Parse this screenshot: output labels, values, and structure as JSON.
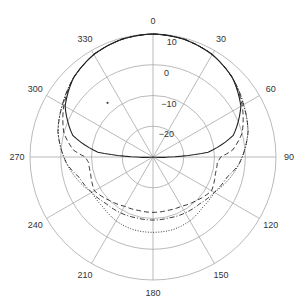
{
  "chart_data": {
    "type": "polar",
    "title": "",
    "angle_unit": "deg",
    "angle_direction": "clockwise",
    "zero_location": "top",
    "angle_ticks": [
      0,
      30,
      60,
      90,
      120,
      150,
      180,
      210,
      240,
      270,
      300,
      330
    ],
    "angle_tick_labels": [
      "0",
      "30",
      "60",
      "90",
      "120",
      "150",
      "180",
      "210",
      "240",
      "270",
      "300",
      "330"
    ],
    "radial_ticks": [
      -20,
      -10,
      0,
      10
    ],
    "radial_tick_labels": [
      "-20",
      "-10",
      "0",
      "10"
    ],
    "rlim": [
      -30,
      10
    ],
    "radial_label_angle": 5,
    "grid": true,
    "legend": null,
    "series": [
      {
        "name": "solid",
        "style": "solid",
        "angles": [
          0,
          15,
          30,
          45,
          60,
          75,
          85,
          90,
          95,
          105,
          120,
          135,
          150,
          165,
          180,
          195,
          210,
          225,
          240,
          255,
          265,
          270,
          275,
          285,
          300,
          315,
          330,
          345,
          360
        ],
        "values": [
          10,
          9.6,
          8.5,
          6.5,
          3,
          -3,
          -12,
          -25,
          -29,
          -30,
          -30,
          -30,
          -30,
          -30,
          -30,
          -30,
          -30,
          -30,
          -30,
          -30,
          -29,
          -25,
          -12,
          -3,
          3,
          6.5,
          8.5,
          9.6,
          10
        ]
      },
      {
        "name": "dashed",
        "style": "dashed",
        "angles": [
          0,
          15,
          30,
          45,
          60,
          75,
          85,
          90,
          95,
          105,
          120,
          135,
          150,
          165,
          180,
          195,
          210,
          225,
          240,
          255,
          265,
          270,
          275,
          285,
          300,
          315,
          330,
          345,
          360
        ],
        "values": [
          10,
          9.6,
          8.5,
          6.5,
          3.5,
          0,
          -4,
          -8,
          -9,
          -9,
          -8,
          -10,
          -11.5,
          -12,
          -12,
          -12,
          -11.5,
          -10,
          -8,
          -9,
          -9,
          -8,
          -4,
          0,
          3.5,
          6.5,
          8.5,
          9.6,
          10
        ]
      },
      {
        "name": "dash-dot",
        "style": "dashdot",
        "angles": [
          0,
          15,
          30,
          45,
          60,
          75,
          85,
          90,
          95,
          105,
          120,
          135,
          150,
          165,
          180,
          195,
          210,
          225,
          240,
          255,
          265,
          270,
          275,
          285,
          300,
          315,
          330,
          345,
          360
        ],
        "values": [
          10,
          9.6,
          8.5,
          6.5,
          4,
          2,
          0,
          -1,
          -2,
          -5,
          -7,
          -8.5,
          -9,
          -9.5,
          -9.5,
          -9.5,
          -9,
          -8.5,
          -7,
          -5,
          -2,
          -1,
          0,
          2,
          4,
          6.5,
          8.5,
          9.6,
          10
        ]
      },
      {
        "name": "dotted",
        "style": "dotted",
        "angles": [
          0,
          15,
          30,
          45,
          60,
          75,
          85,
          90,
          95,
          105,
          120,
          135,
          150,
          165,
          180,
          195,
          210,
          225,
          240,
          255,
          265,
          270,
          275,
          285,
          300,
          315,
          330,
          345,
          360
        ],
        "values": [
          10,
          9.6,
          8.5,
          6.5,
          4,
          2,
          0,
          -1,
          -2,
          -4,
          -7,
          -7,
          -6,
          -5.5,
          -5.5,
          -5.5,
          -6,
          -7,
          -7,
          -4,
          -2,
          -1,
          0,
          2,
          4,
          6.5,
          8.5,
          9.6,
          10
        ]
      }
    ],
    "annotations": [
      {
        "type": "dot",
        "angle": 320,
        "value": -7
      }
    ]
  },
  "colors": {
    "grid": "#a8a8a8",
    "axis_text": "#333333",
    "series": "#222222"
  }
}
